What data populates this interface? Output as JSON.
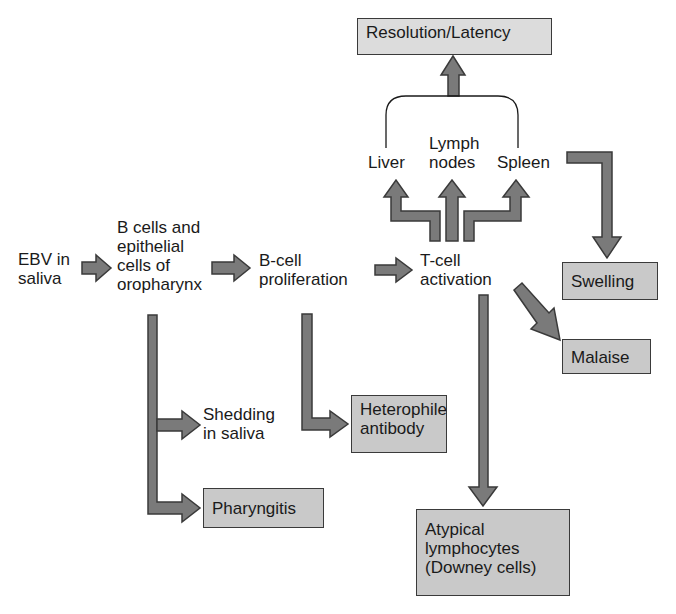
{
  "diagram": {
    "colors": {
      "arrow_fill": "#7a7a7a",
      "arrow_stroke": "#3a3a3a",
      "box_fill": "#c9c9c9",
      "top_box_fill": "#dcdcdc",
      "text": "#1a1a1a"
    },
    "nodes": {
      "ebv": "EBV in\nsaliva",
      "bcells": "B cells and\nepithelial\ncells of\noropharynx",
      "prolif": "B-cell\nproliferation",
      "tcell": "T-cell\nactivation",
      "liver": "Liver",
      "lymph": "Lymph\nnodes",
      "spleen": "Spleen",
      "resolution": "Resolution/Latency",
      "swelling": "Swelling",
      "malaise": "Malaise",
      "shedding": "Shedding\nin saliva",
      "heterophile": "Heterophile\nantibody",
      "pharyngitis": "Pharyngitis",
      "atypical": "Atypical\nlymphocytes\n(Downey cells)"
    },
    "edges": [
      {
        "from": "EBV in saliva",
        "to": "B cells and epithelial cells of oropharynx"
      },
      {
        "from": "B cells and epithelial cells of oropharynx",
        "to": "B-cell proliferation"
      },
      {
        "from": "B cells and epithelial cells of oropharynx",
        "to": "Shedding in saliva"
      },
      {
        "from": "B cells and epithelial cells of oropharynx",
        "to": "Pharyngitis"
      },
      {
        "from": "B-cell proliferation",
        "to": "T-cell activation"
      },
      {
        "from": "B-cell proliferation",
        "to": "Heterophile antibody"
      },
      {
        "from": "T-cell activation",
        "to": "Liver"
      },
      {
        "from": "T-cell activation",
        "to": "Lymph nodes"
      },
      {
        "from": "T-cell activation",
        "to": "Spleen"
      },
      {
        "from": "T-cell activation",
        "to": "Malaise"
      },
      {
        "from": "T-cell activation",
        "to": "Atypical lymphocytes (Downey cells)"
      },
      {
        "from": "Liver / Lymph nodes / Spleen",
        "to": "Resolution/Latency"
      },
      {
        "from": "Spleen",
        "to": "Swelling"
      }
    ]
  }
}
